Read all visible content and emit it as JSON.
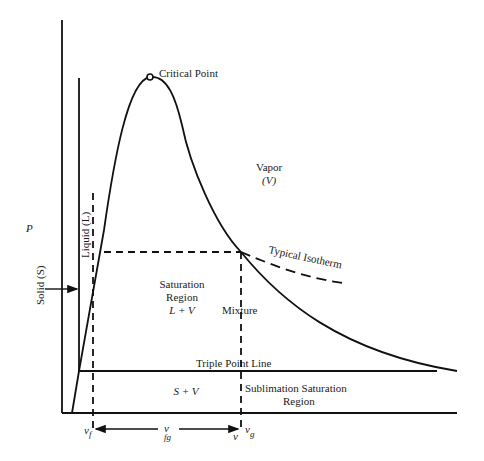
{
  "diagram": {
    "axis": {
      "y_label": "P"
    },
    "labels": {
      "critical_point": "Critical Point",
      "vapor": "Vapor",
      "vapor_symbol": "(V)",
      "liquid": "Liquid (L)",
      "solid": "Solid (S)",
      "saturation_line1": "Saturation",
      "saturation_line2": "Region",
      "saturation_line3": "L + V",
      "mixture": "Mixture",
      "typical_isotherm": "Typical Isotherm",
      "triple_point_line": "Triple Point Line",
      "solid_vapor": "S + V",
      "sublimation_line1": "Sublimation Saturation",
      "sublimation_line2": "Region"
    },
    "specific_volume": {
      "vf_base": "v",
      "vf_sub": "f",
      "vfg_base": "v",
      "vfg_sub": "fg",
      "v": "v",
      "vg_base": "v",
      "vg_sub": "g"
    },
    "colors": {
      "line": "#111111",
      "background": "#ffffff"
    }
  }
}
